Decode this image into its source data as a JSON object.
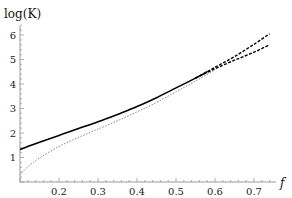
{
  "chart_data": {
    "type": "line",
    "title": "",
    "xlabel": "f",
    "ylabel": "log(K)",
    "xlim": [
      0.1,
      0.76
    ],
    "ylim": [
      0,
      6.4
    ],
    "grid": false,
    "legend": null,
    "x_ticks": [
      0.2,
      0.3,
      0.4,
      0.5,
      0.6,
      0.7
    ],
    "x_tick_labels": [
      "0.2",
      "0.3",
      "0.4",
      "0.5",
      "0.6",
      "0.7"
    ],
    "y_ticks": [
      1,
      2,
      3,
      4,
      5,
      6
    ],
    "y_tick_labels": [
      "1",
      "2",
      "3",
      "4",
      "5",
      "6"
    ],
    "series": [
      {
        "name": "solid",
        "style": "solid",
        "color": "#000000",
        "x": [
          0.1,
          0.15,
          0.2,
          0.25,
          0.3,
          0.35,
          0.4,
          0.45,
          0.5,
          0.55,
          0.58
        ],
        "y": [
          1.33,
          1.62,
          1.9,
          2.18,
          2.46,
          2.76,
          3.08,
          3.44,
          3.84,
          4.24,
          4.5
        ]
      },
      {
        "name": "dashed-upper",
        "style": "dashed",
        "color": "#000000",
        "x": [
          0.55,
          0.6,
          0.65,
          0.7,
          0.74
        ],
        "y": [
          4.24,
          4.68,
          5.12,
          5.62,
          6.05
        ]
      },
      {
        "name": "dashed-lower",
        "style": "dashed",
        "color": "#000000",
        "x": [
          0.55,
          0.6,
          0.65,
          0.7,
          0.74
        ],
        "y": [
          4.24,
          4.62,
          4.97,
          5.3,
          5.6
        ]
      },
      {
        "name": "dotted",
        "style": "dotted",
        "color": "#888888",
        "x": [
          0.1,
          0.12,
          0.15,
          0.2,
          0.25,
          0.3,
          0.35,
          0.4,
          0.45,
          0.5,
          0.55,
          0.6
        ],
        "y": [
          0.3,
          0.62,
          0.98,
          1.45,
          1.82,
          2.16,
          2.5,
          2.86,
          3.25,
          3.68,
          4.12,
          4.58
        ]
      }
    ]
  }
}
